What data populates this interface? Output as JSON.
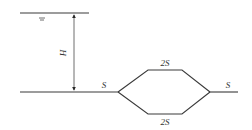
{
  "diagram": {
    "type": "pipe-system",
    "labels": {
      "water_level_symbol": "≡",
      "head": "H",
      "inlet_pipe": "S",
      "upper_branch": "2S",
      "lower_branch": "2S",
      "outlet_pipe": "S"
    },
    "colors": {
      "line": "#3a3a3a",
      "text": "#333333",
      "background": "#ffffff"
    }
  }
}
